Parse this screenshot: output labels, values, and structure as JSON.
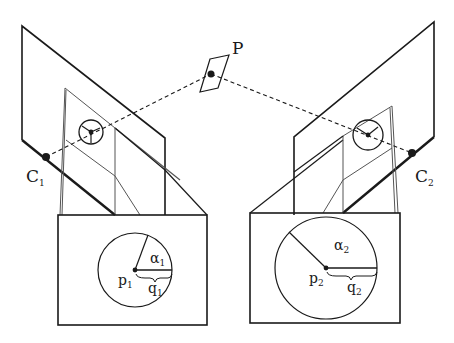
{
  "diagram": {
    "type": "stereo-camera-geometry",
    "colors": {
      "stroke": "#1a1a1a",
      "light_stroke": "#555555",
      "background": "#ffffff"
    },
    "point": {
      "label": "P",
      "x": 208,
      "y": 77
    },
    "cameras": [
      {
        "id": "left",
        "center_label": "C",
        "center_sub": "1",
        "image_point_label": "p",
        "image_point_sub": "1",
        "angle_label": "α",
        "angle_sub": "1",
        "radius_label": "q",
        "radius_sub": "1"
      },
      {
        "id": "right",
        "center_label": "C",
        "center_sub": "2",
        "image_point_label": "p",
        "image_point_sub": "2",
        "angle_label": "α",
        "angle_sub": "2",
        "radius_label": "q",
        "radius_sub": "2"
      }
    ]
  }
}
